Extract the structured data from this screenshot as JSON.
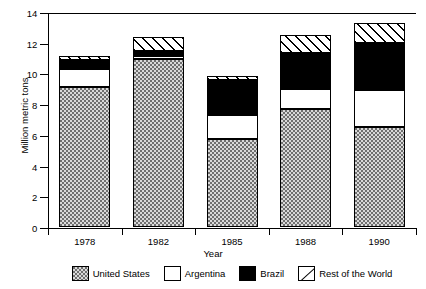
{
  "chart_data": {
    "type": "bar",
    "subtype": "stacked-bar",
    "title": "",
    "xlabel": "Year",
    "ylabel": "Million metric tons",
    "categories": [
      "1978",
      "1982",
      "1985",
      "1988",
      "1990"
    ],
    "ylim": [
      0,
      14
    ],
    "yticks": [
      0,
      2,
      4,
      6,
      8,
      10,
      12,
      14
    ],
    "grid": false,
    "legend_position": "bottom",
    "series": [
      {
        "name": "United States",
        "values": [
          9.1,
          10.9,
          5.75,
          7.65,
          6.5
        ],
        "fill": "dotted-gray",
        "color": "#d9d9d9"
      },
      {
        "name": "Argentina",
        "values": [
          1.2,
          0.2,
          1.5,
          1.35,
          2.4
        ],
        "fill": "solid-white",
        "color": "#ffffff"
      },
      {
        "name": "Brazil",
        "values": [
          0.55,
          0.35,
          2.3,
          2.35,
          3.1
        ],
        "fill": "solid-black",
        "color": "#000000"
      },
      {
        "name": "Rest of the World",
        "values": [
          0.3,
          0.9,
          0.25,
          1.15,
          1.3
        ],
        "fill": "diagonal-hatch",
        "color": "#ffffff"
      }
    ],
    "totals": [
      11.15,
      12.35,
      9.8,
      12.5,
      13.3
    ]
  },
  "axis": {
    "y": {
      "label": "Million metric tons",
      "tick_labels": [
        "0",
        "2",
        "4",
        "6",
        "8",
        "10",
        "12",
        "14"
      ]
    },
    "x": {
      "label": "Year",
      "tick_labels": [
        "1978",
        "1982",
        "1985",
        "1988",
        "1990"
      ]
    }
  },
  "legend": {
    "entries": [
      {
        "label": "United States",
        "swatch": "dotted-gray-swatch"
      },
      {
        "label": "Argentina",
        "swatch": "white-swatch"
      },
      {
        "label": "Brazil",
        "swatch": "black-swatch"
      },
      {
        "label": "Rest of the World",
        "swatch": "hatched-swatch"
      }
    ]
  }
}
